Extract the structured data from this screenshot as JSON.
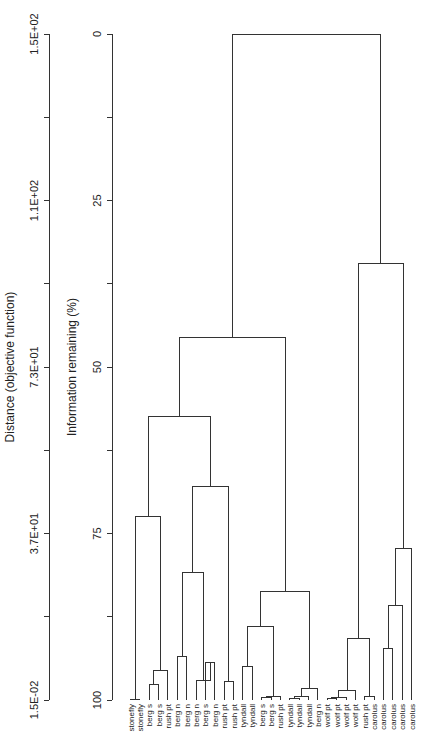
{
  "chart_data": {
    "type": "dendrogram",
    "title": "",
    "orientation": "leaves at bottom, root at top; labels rotated 90 degrees",
    "axes": {
      "distance": {
        "label": "Distance (objective function)",
        "ticks": [
          "1.5E-02",
          "3.7E+01",
          "7.3E+01",
          "1.1E+02",
          "1.5E+02"
        ],
        "range": [
          0.015,
          150
        ]
      },
      "information": {
        "label": "Information remaining (%)",
        "ticks": [
          "100",
          "75",
          "50",
          "25",
          "0"
        ],
        "range": [
          100,
          0
        ]
      }
    },
    "leaves": [
      "stonefly",
      "stonefly",
      "berg s",
      "berg s",
      "rush pt",
      "berg n",
      "berg n",
      "berg n",
      "berg s",
      "berg n",
      "rush pt",
      "rush pt",
      "tyndall",
      "tyndall",
      "berg s",
      "berg s",
      "rush pt",
      "tyndall",
      "tyndall",
      "tyndall",
      "berg n",
      "wolf pt",
      "wolf pt",
      "wolf pt",
      "wolf pt",
      "rush pt",
      "carolus",
      "carolus",
      "carolus",
      "carolus",
      "carolus"
    ],
    "merges_information_remaining_pct": [
      {
        "id": "m1",
        "left": 0,
        "right": 1,
        "height": 99.9
      },
      {
        "id": "m2",
        "left": 2,
        "right": 3,
        "height": 97.6
      },
      {
        "id": "m3",
        "left": "m2",
        "right": 4,
        "height": 95.6
      },
      {
        "id": "m4",
        "left": "m1",
        "right": "m3",
        "height": 72.4
      },
      {
        "id": "m5",
        "left": 5,
        "right": 6,
        "height": 93.5
      },
      {
        "id": "m6",
        "left": 8,
        "right": 9,
        "height": 94.3
      },
      {
        "id": "m7",
        "left": 7,
        "right": "m6",
        "height": 97.0
      },
      {
        "id": "m8",
        "left": "m5",
        "right": "m7",
        "height": 80.9
      },
      {
        "id": "m9",
        "left": 10,
        "right": 11,
        "height": 97.2
      },
      {
        "id": "m10",
        "left": "m9",
        "right": "m8",
        "height": 67.9
      },
      {
        "id": "m11",
        "left": "m4",
        "right": "m10",
        "height": 57.4
      },
      {
        "id": "m12",
        "left": 12,
        "right": 13,
        "height": 95.0
      },
      {
        "id": "m13",
        "left": 14,
        "right": 15,
        "height": 99.6
      },
      {
        "id": "m14",
        "left": "m13",
        "right": 16,
        "height": 99.4
      },
      {
        "id": "m15",
        "left": "m12",
        "right": "m14",
        "height": 88.9
      },
      {
        "id": "m16",
        "left": 17,
        "right": 18,
        "height": 99.7
      },
      {
        "id": "m17",
        "left": "m16",
        "right": 19,
        "height": 99.5
      },
      {
        "id": "m18",
        "left": "m17",
        "right": 20,
        "height": 98.2
      },
      {
        "id": "m19",
        "left": "m15",
        "right": "m18",
        "height": 83.7
      },
      {
        "id": "m20",
        "left": "m11",
        "right": "m19",
        "height": 45.5
      },
      {
        "id": "m21",
        "left": 21,
        "right": 22,
        "height": 99.8
      },
      {
        "id": "m22",
        "left": "m21",
        "right": 23,
        "height": 99.6
      },
      {
        "id": "m23",
        "left": "m22",
        "right": 24,
        "height": 98.6
      },
      {
        "id": "m24",
        "left": 25,
        "right": 26,
        "height": 99.4
      },
      {
        "id": "m25",
        "left": "m23",
        "right": "m24",
        "height": 90.8
      },
      {
        "id": "m26",
        "left": 27,
        "right": 28,
        "height": 92.3
      },
      {
        "id": "m27",
        "left": "m26",
        "right": 29,
        "height": 85.8
      },
      {
        "id": "m28",
        "left": 30,
        "right": 31,
        "height": 99.0
      },
      {
        "id": "m29",
        "left": "m27",
        "right": "m28",
        "height": 77.2
      },
      {
        "id": "m30",
        "left": "m25",
        "right": "m29",
        "height": 34.5
      },
      {
        "id": "m31",
        "left": "m20",
        "right": "m30",
        "height": 0.0
      }
    ]
  }
}
